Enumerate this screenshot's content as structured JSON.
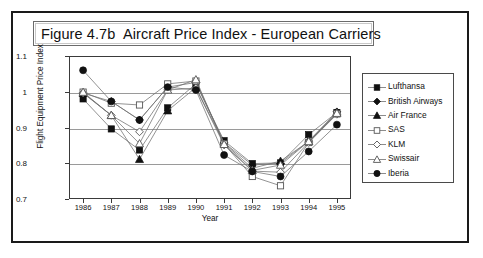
{
  "figure": {
    "title": "Figure 4.7b  Aircraft Price Index - European Carriers"
  },
  "chart_data": {
    "type": "line",
    "title": "Figure 4.7b  Aircraft Price Index - European Carriers",
    "xlabel": "Year",
    "ylabel": "Flight Equipment Price Index",
    "categories": [
      "1986",
      "1987",
      "1988",
      "1989",
      "1990",
      "1991",
      "1992",
      "1993",
      "1994",
      "1995"
    ],
    "ylim": [
      0.7,
      1.1
    ],
    "ytick_labels": [
      "0.7",
      "0.8",
      "0.9",
      "1",
      "1.1"
    ],
    "ytick_values": [
      0.7,
      0.8,
      0.9,
      1.0,
      1.1
    ],
    "grid": true,
    "legend_position": "right",
    "series": [
      {
        "name": "Lufthansa",
        "marker": "filled-square",
        "color": "#111111",
        "values": [
          0.98,
          0.896,
          0.837,
          0.955,
          1.022,
          0.863,
          0.799,
          0.801,
          0.88,
          0.942
        ]
      },
      {
        "name": "British Airways",
        "marker": "filled-diamond",
        "color": "#111111",
        "values": [
          0.996,
          0.973,
          0.921,
          1.013,
          1.026,
          0.857,
          0.795,
          0.8,
          0.862,
          0.944
        ]
      },
      {
        "name": "Air France",
        "marker": "filled-triangle",
        "color": "#111111",
        "values": [
          0.996,
          0.934,
          0.811,
          0.947,
          1.012,
          0.856,
          0.786,
          0.806,
          0.861,
          0.941
        ]
      },
      {
        "name": "SAS",
        "marker": "open-square",
        "color": "#555555",
        "values": [
          0.999,
          0.968,
          0.963,
          1.022,
          1.03,
          0.854,
          0.763,
          0.737,
          0.858,
          0.938
        ]
      },
      {
        "name": "KLM",
        "marker": "open-diamond",
        "color": "#555555",
        "values": [
          0.997,
          0.934,
          0.888,
          1.005,
          1.01,
          0.851,
          0.778,
          0.775,
          0.858,
          0.937
        ]
      },
      {
        "name": "Swissair",
        "marker": "open-triangle",
        "color": "#555555",
        "values": [
          0.999,
          0.934,
          0.855,
          1.005,
          1.034,
          0.853,
          0.78,
          0.795,
          0.861,
          0.94
        ]
      },
      {
        "name": "Iberia",
        "marker": "filled-circle",
        "color": "#111111",
        "values": [
          1.06,
          0.973,
          0.921,
          1.013,
          1.005,
          0.823,
          0.777,
          0.763,
          0.833,
          0.908
        ]
      }
    ]
  },
  "legend": {
    "items": [
      {
        "label": "Lufthansa"
      },
      {
        "label": "British Airways"
      },
      {
        "label": "Air France"
      },
      {
        "label": "SAS"
      },
      {
        "label": "KLM"
      },
      {
        "label": "Swissair"
      },
      {
        "label": "Iberia"
      }
    ]
  }
}
